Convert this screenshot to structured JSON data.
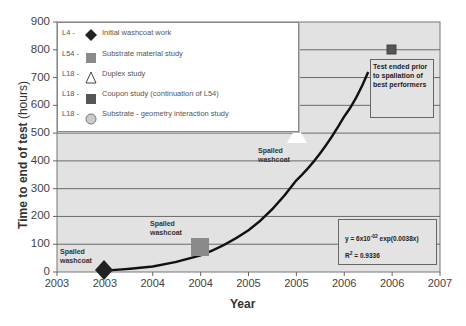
{
  "chart_data": {
    "type": "scatter",
    "title": "",
    "xlabel": "Year",
    "ylabel_bold": "Time to end of test",
    "ylabel_unit": "(hours)",
    "ylim": [
      0,
      900
    ],
    "yticks": [
      "0",
      "100",
      "200",
      "300",
      "400",
      "500",
      "600",
      "700",
      "800",
      "900"
    ],
    "xticks": [
      "2003",
      "2003",
      "2004",
      "2004",
      "2005",
      "2005",
      "2006",
      "2006",
      "2007"
    ],
    "grid": true,
    "legend_position": "top-left inside",
    "series": [
      {
        "code": "L4 -",
        "name": "Initial washcoat work",
        "marker": "diamond",
        "color": "#222222",
        "x_index": 1.0,
        "y": 10
      },
      {
        "code": "L54 -",
        "name": "Substrate material study",
        "marker": "square",
        "color": "#8a8a8a",
        "x_index": 3.0,
        "y": 90
      },
      {
        "code": "L18 -",
        "name": "Duplex study",
        "marker": "triangle-open",
        "color": "#ffffff",
        "x_index": 5.0,
        "y": 495
      },
      {
        "code": "L18 -",
        "name": "Coupon study (continuation of L54)",
        "marker": "square",
        "color": "#555555",
        "x_index": 7.0,
        "y": 800
      },
      {
        "code": "L18 -",
        "name": "Substrate - geometry interaction study",
        "marker": "circle",
        "color": "#cccccc",
        "x_index": null,
        "y": null
      }
    ],
    "trendline": {
      "type": "exponential",
      "equation": "y = 6x10",
      "exponent": "-02",
      "equation_tail": " exp(0.0038x)",
      "r2_label": "R",
      "r2_sup": "2",
      "r2_value": " = 0.9336",
      "approx_points": [
        [
          1.0,
          5
        ],
        [
          2.0,
          20
        ],
        [
          3.0,
          60
        ],
        [
          4.0,
          150
        ],
        [
          5.0,
          330
        ],
        [
          6.0,
          560
        ],
        [
          6.5,
          720
        ]
      ]
    },
    "annotations": [
      {
        "text": [
          "Spalled",
          "washcoat"
        ],
        "near": "L4 point"
      },
      {
        "text": [
          "Spalled",
          "washcoat"
        ],
        "near": "L54 point"
      },
      {
        "text": [
          "Spalled",
          "washcoat"
        ],
        "near": "Duplex point"
      },
      {
        "text": [
          "Test ended prior",
          "to spallation of",
          "best performers"
        ],
        "near": "Coupon point"
      }
    ]
  },
  "notes": {
    "spall1": [
      "Spalled",
      "washcoat"
    ],
    "spall2": [
      "Spalled",
      "washcoat"
    ],
    "spall3": [
      "Spalled",
      "washcoat"
    ],
    "test_ended": [
      "Test ended prior",
      "to spallation of",
      "best performers"
    ]
  }
}
